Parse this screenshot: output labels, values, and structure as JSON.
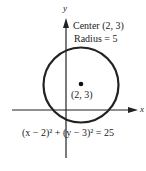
{
  "diagram": {
    "axes": {
      "x_label": "x",
      "y_label": "y"
    },
    "annotation": {
      "center_line": "Center (2, 3)",
      "radius_line": "Radius = 5"
    },
    "point_label": "(2, 3)",
    "equation": "(x − 2)² + (y − 3)² = 25",
    "circle": {
      "center": [
        2,
        3
      ],
      "radius": 5
    }
  }
}
